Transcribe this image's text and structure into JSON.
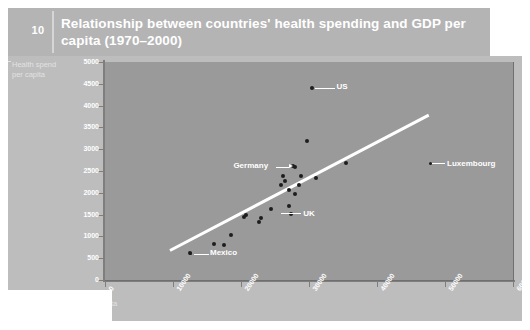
{
  "header": {
    "page_number": "10",
    "title": "Relationship between countries' health spending and GDP per capita (1970–2000)"
  },
  "colors": {
    "slide_bg": "#bdbdbd",
    "header_band": "#b4b4b4",
    "plot_bg": "#9a9a9a",
    "trend_line": "#ffffff",
    "point": "#1d1d1d",
    "label_text": "#ffffff"
  },
  "chart_data": {
    "type": "scatter",
    "title": "Relationship between countries' health spending and GDP per capita (1970–2000)",
    "xlabel": "GDP per capita",
    "ylabel": "Health spend per capita",
    "xlim": [
      0,
      60000
    ],
    "ylim": [
      0,
      5000
    ],
    "xticks": [
      "0",
      "10000",
      "20000",
      "30000",
      "40000",
      "50000",
      "60000"
    ],
    "yticks": [
      "0",
      "500",
      "1000",
      "1500",
      "2000",
      "2500",
      "3000",
      "3500",
      "4000",
      "4500",
      "5000"
    ],
    "grid": false,
    "legend": "none",
    "trendline": {
      "x0": 9500,
      "y0": 700,
      "x1": 47500,
      "y1": 3800
    },
    "points": [
      {
        "x": 12500,
        "y": 620,
        "label": "Mexico"
      },
      {
        "x": 16000,
        "y": 830,
        "label": ""
      },
      {
        "x": 17500,
        "y": 800,
        "label": ""
      },
      {
        "x": 18500,
        "y": 1030,
        "label": ""
      },
      {
        "x": 20500,
        "y": 1450,
        "label": ""
      },
      {
        "x": 20800,
        "y": 1500,
        "label": ""
      },
      {
        "x": 22700,
        "y": 1320,
        "label": ""
      },
      {
        "x": 22900,
        "y": 1420,
        "label": ""
      },
      {
        "x": 24400,
        "y": 1620,
        "label": ""
      },
      {
        "x": 25900,
        "y": 2170,
        "label": ""
      },
      {
        "x": 26200,
        "y": 2380,
        "label": ""
      },
      {
        "x": 26400,
        "y": 2280,
        "label": ""
      },
      {
        "x": 27000,
        "y": 2060,
        "label": ""
      },
      {
        "x": 27100,
        "y": 1700,
        "label": "UK"
      },
      {
        "x": 27300,
        "y": 1520,
        "label": ""
      },
      {
        "x": 27600,
        "y": 2620,
        "label": ""
      },
      {
        "x": 27900,
        "y": 1980,
        "label": ""
      },
      {
        "x": 28500,
        "y": 2190,
        "label": ""
      },
      {
        "x": 28800,
        "y": 2380,
        "label": ""
      },
      {
        "x": 29700,
        "y": 3190,
        "label": ""
      },
      {
        "x": 30500,
        "y": 4400,
        "label": "US"
      },
      {
        "x": 31000,
        "y": 2330,
        "label": ""
      },
      {
        "x": 35500,
        "y": 2680,
        "label": ""
      },
      {
        "x": 28000,
        "y": 2600,
        "label": "Germany"
      }
    ],
    "annotations": [
      {
        "name": "US",
        "label": "US"
      },
      {
        "name": "Germany",
        "label": "Germany"
      },
      {
        "name": "UK",
        "label": "UK"
      },
      {
        "name": "Mexico",
        "label": "Mexico"
      },
      {
        "name": "Luxembourg",
        "label": "Luxembourg"
      }
    ]
  },
  "axes": {
    "y_title_line1": "Health spend",
    "y_title_line2": "per capita",
    "x_title": "GDP per capita",
    "y": {
      "t0": "0",
      "t1": "500",
      "t2": "1000",
      "t3": "1500",
      "t4": "2000",
      "t5": "2500",
      "t6": "3000",
      "t7": "3500",
      "t8": "4000",
      "t9": "4500",
      "t10": "5000"
    },
    "x": {
      "t0": "0",
      "t1": "10000",
      "t2": "20000",
      "t3": "30000",
      "t4": "40000",
      "t5": "50000",
      "t6": "60000"
    }
  },
  "labels": {
    "us": "US",
    "germany": "Germany",
    "uk": "UK",
    "mexico": "Mexico",
    "luxembourg": "Luxembourg"
  }
}
